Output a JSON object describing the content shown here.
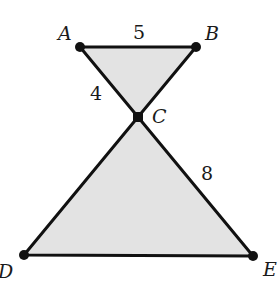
{
  "diagram": {
    "type": "geometry",
    "fill_color": "#e3e3e3",
    "stroke_color": "#111111",
    "points": {
      "A": {
        "label": "A",
        "x": 80,
        "y": 47
      },
      "B": {
        "label": "B",
        "x": 196,
        "y": 47
      },
      "C": {
        "label": "C",
        "x": 138,
        "y": 117
      },
      "D": {
        "label": "D",
        "x": 24,
        "y": 255
      },
      "E": {
        "label": "E",
        "x": 253,
        "y": 256
      }
    },
    "segment_lengths": {
      "AB": "5",
      "AC": "4",
      "CE": "8"
    },
    "triangles": [
      "ABC",
      "DCE"
    ]
  }
}
